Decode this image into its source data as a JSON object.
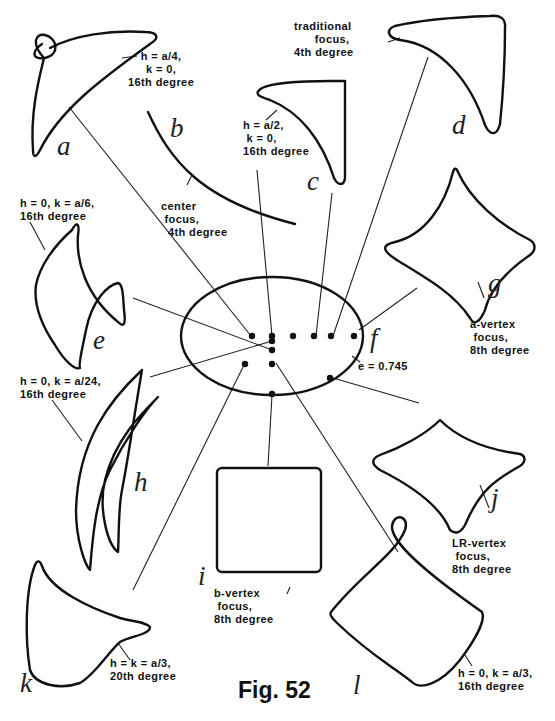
{
  "figure": {
    "title": "Fig. 52",
    "center_ellipse": {
      "letter": "f",
      "label": "e = 0.745"
    },
    "curves": [
      {
        "letter": "a",
        "label": "h = a/4,\nk = 0,\n16th degree"
      },
      {
        "letter": "b",
        "label": "center\n focus,\n  4th degree"
      },
      {
        "letter": "c",
        "label": "h = a/2,\n k = 0,\n16th degree"
      },
      {
        "letter": "d",
        "label": "traditional\n      focus,\n4th degree"
      },
      {
        "letter": "e",
        "label": "h = 0, k = a/6,\n16th degree"
      },
      {
        "letter": "g",
        "label": "a-vertex\n focus,\n8th degree"
      },
      {
        "letter": "h",
        "label": "h = 0, k = a/24,\n16th degree"
      },
      {
        "letter": "i",
        "label": "b-vertex\n focus,\n8th degree"
      },
      {
        "letter": "j",
        "label": "LR-vertex\n focus,\n8th degree"
      },
      {
        "letter": "k",
        "label": "h = k = a/3,\n20th degree"
      },
      {
        "letter": "l",
        "label": "h = 0, k = a/3,\n16th degree"
      }
    ]
  }
}
